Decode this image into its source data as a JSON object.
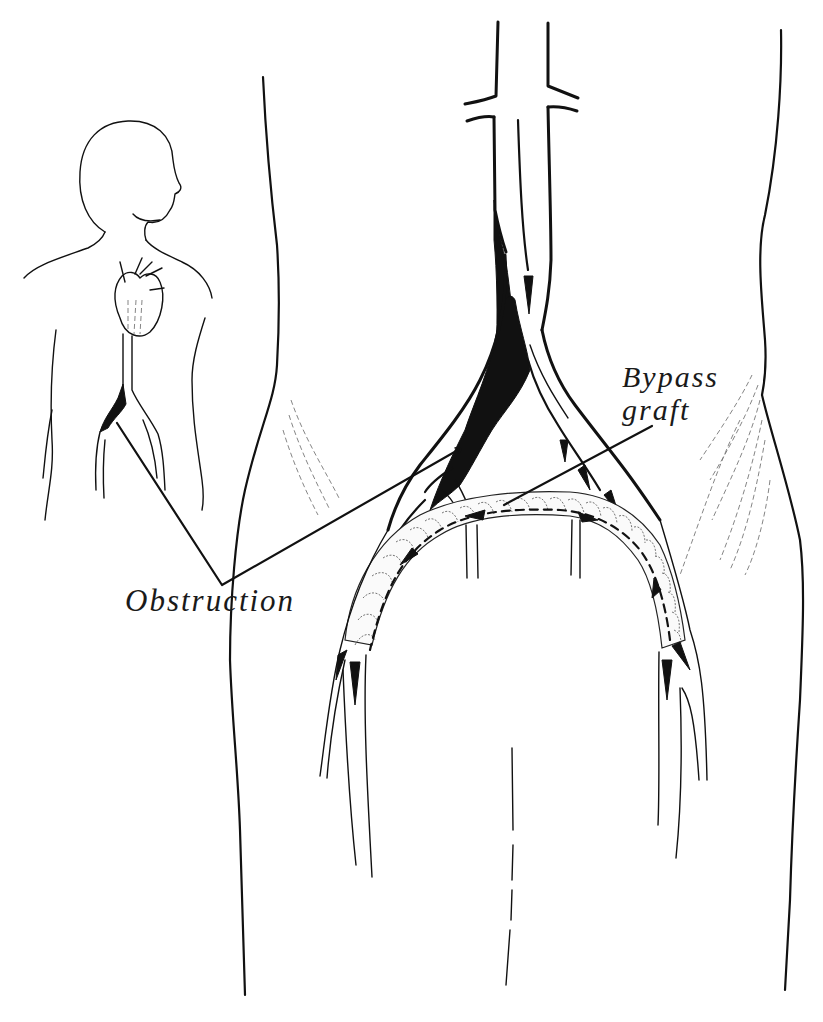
{
  "figure": {
    "type": "medical-illustration",
    "ink_color": "#111111",
    "background_color": "#ffffff"
  },
  "labels": {
    "bypass_graft_line1": "Bypass",
    "bypass_graft_line2": "graft",
    "obstruction": "Obstruction"
  },
  "elements": {
    "inset_figure": "human torso silhouette with heart and aorta",
    "main_view": "lower abdomen and pelvis with aortic bifurcation",
    "obstruction_site": "left iliac artery (filled black)",
    "graft": "ringed crossover tube from right to left femoral artery",
    "flow_arrows": "downward through aorta, across graft right-to-left, down both legs"
  }
}
